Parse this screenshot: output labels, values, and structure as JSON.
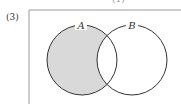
{
  "problem_label": "(3)",
  "top_mark": "(1)",
  "venn": {
    "sets": [
      {
        "name": "A",
        "shaded": "only-A"
      },
      {
        "name": "B",
        "shaded": "none"
      }
    ],
    "shaded_region": "A − B",
    "colors": {
      "shade": "#d9d9d9",
      "stroke": "#333333",
      "frame": "#999999"
    }
  }
}
